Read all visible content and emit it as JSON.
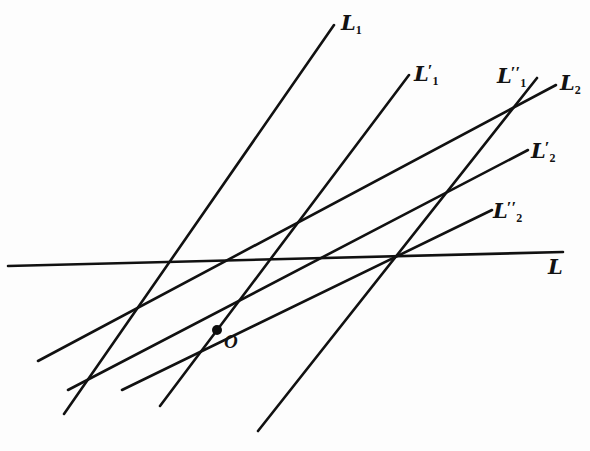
{
  "figure": {
    "background_color": "#fdfdfd",
    "ink_color": "#111111",
    "width": 590,
    "height": 451,
    "lines": [
      {
        "id": "L1",
        "name": "line-L1",
        "base": "L",
        "sub": "1",
        "primes": "",
        "x1": 64,
        "y1": 414,
        "x2": 334,
        "y2": 25,
        "stroke_width": 2.6,
        "orientation": "steep-rising"
      },
      {
        "id": "L1p",
        "name": "line-L1-prime",
        "base": "L",
        "sub": "1",
        "primes": "'",
        "x1": 160,
        "y1": 406,
        "x2": 409,
        "y2": 75,
        "stroke_width": 2.6,
        "orientation": "steep-rising"
      },
      {
        "id": "L1pp",
        "name": "line-L1-double-prime",
        "base": "L",
        "sub": "1",
        "primes": "''",
        "x1": 258,
        "y1": 431,
        "x2": 537,
        "y2": 78,
        "stroke_width": 2.6,
        "orientation": "steep-rising"
      },
      {
        "id": "L2",
        "name": "line-L2",
        "base": "L",
        "sub": "2",
        "primes": "",
        "x1": 38,
        "y1": 361,
        "x2": 556,
        "y2": 85,
        "stroke_width": 2.6,
        "orientation": "shallow-rising"
      },
      {
        "id": "L2p",
        "name": "line-L2-prime",
        "base": "L",
        "sub": "2",
        "primes": "'",
        "x1": 68,
        "y1": 390,
        "x2": 528,
        "y2": 150,
        "stroke_width": 2.6,
        "orientation": "shallow-rising"
      },
      {
        "id": "L2pp",
        "name": "line-L2-double-prime",
        "base": "L",
        "sub": "2",
        "primes": "''",
        "x1": 122,
        "y1": 390,
        "x2": 492,
        "y2": 210,
        "stroke_width": 2.6,
        "orientation": "shallow-rising"
      },
      {
        "id": "L",
        "name": "line-L-axis",
        "base": "L",
        "sub": "",
        "primes": "",
        "x1": 8,
        "y1": 266,
        "x2": 563,
        "y2": 252,
        "stroke_width": 2.6,
        "orientation": "near-horizontal"
      }
    ],
    "labels": [
      {
        "id": "lbl-L1",
        "name": "label-L1",
        "text_base": "L",
        "sub": "1",
        "primes": "",
        "x": 341,
        "y": 12
      },
      {
        "id": "lbl-L1p",
        "name": "label-L1-prime",
        "text_base": "L",
        "sub": "1",
        "primes": "'",
        "x": 414,
        "y": 62
      },
      {
        "id": "lbl-L1pp",
        "name": "label-L1-double-prime",
        "text_base": "L",
        "sub": "1",
        "primes": "''",
        "x": 497,
        "y": 64
      },
      {
        "id": "lbl-L2",
        "name": "label-L2",
        "text_base": "L",
        "sub": "2",
        "primes": "",
        "x": 560,
        "y": 72
      },
      {
        "id": "lbl-L2p",
        "name": "label-L2-prime",
        "text_base": "L",
        "sub": "2",
        "primes": "'",
        "x": 531,
        "y": 139
      },
      {
        "id": "lbl-L2pp",
        "name": "label-L2-double-prime",
        "text_base": "L",
        "sub": "2",
        "primes": "''",
        "x": 493,
        "y": 199
      },
      {
        "id": "lbl-L",
        "name": "label-L-axis",
        "text_base": "L",
        "sub": "",
        "primes": "",
        "x": 548,
        "y": 256
      }
    ],
    "points": [
      {
        "id": "O",
        "name": "point-O",
        "label": "O",
        "x": 217,
        "y": 330,
        "radius": 5.0,
        "label_x": 224,
        "label_y": 332
      }
    ],
    "intersections_on_axis": [
      {
        "name": "vertex-left",
        "x": 152,
        "y": 263
      },
      {
        "name": "vertex-middle",
        "x": 272,
        "y": 261
      },
      {
        "name": "vertex-right",
        "x": 395,
        "y": 258
      }
    ]
  }
}
